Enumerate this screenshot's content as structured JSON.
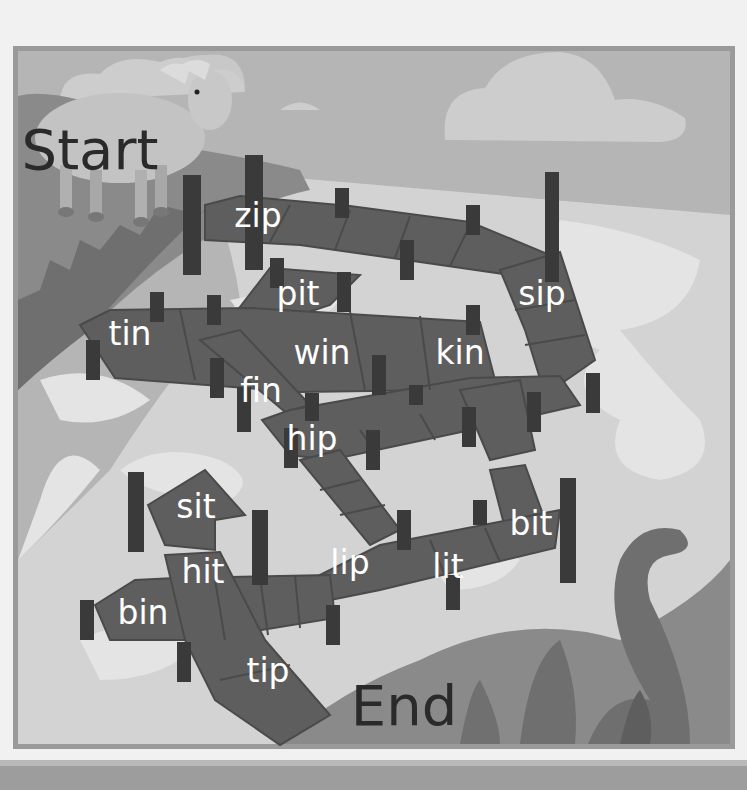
{
  "maze": {
    "start_label": "Start",
    "end_label": "End",
    "words": [
      {
        "text": "zip",
        "x": 258,
        "y": 215
      },
      {
        "text": "pit",
        "x": 298,
        "y": 293
      },
      {
        "text": "sip",
        "x": 542,
        "y": 293
      },
      {
        "text": "tin",
        "x": 130,
        "y": 333
      },
      {
        "text": "win",
        "x": 322,
        "y": 352
      },
      {
        "text": "kin",
        "x": 460,
        "y": 352
      },
      {
        "text": "fin",
        "x": 261,
        "y": 390
      },
      {
        "text": "hip",
        "x": 312,
        "y": 438
      },
      {
        "text": "sit",
        "x": 196,
        "y": 506
      },
      {
        "text": "bit",
        "x": 531,
        "y": 523
      },
      {
        "text": "hit",
        "x": 203,
        "y": 571
      },
      {
        "text": "lip",
        "x": 350,
        "y": 562
      },
      {
        "text": "lit",
        "x": 448,
        "y": 566
      },
      {
        "text": "bin",
        "x": 143,
        "y": 612
      },
      {
        "text": "tip",
        "x": 268,
        "y": 670
      }
    ],
    "start_pos": {
      "x": 90,
      "y": 150
    },
    "end_pos": {
      "x": 404,
      "y": 706
    }
  },
  "colors": {
    "page_bg": "#f1f1f1",
    "frame_border": "#9a9a9a",
    "sky": "#b5b5b5",
    "cloud": "#cdcdcd",
    "water": "#d3d3d3",
    "water_light": "#e4e4e4",
    "grass": "#8a8a8a",
    "grass_dark": "#6f6f6f",
    "plank": "#5e5e5e",
    "plank_line": "#4a4a4a",
    "post": "#3a3a3a",
    "text_white": "#ffffff",
    "text_dark": "#2a2a2a"
  }
}
